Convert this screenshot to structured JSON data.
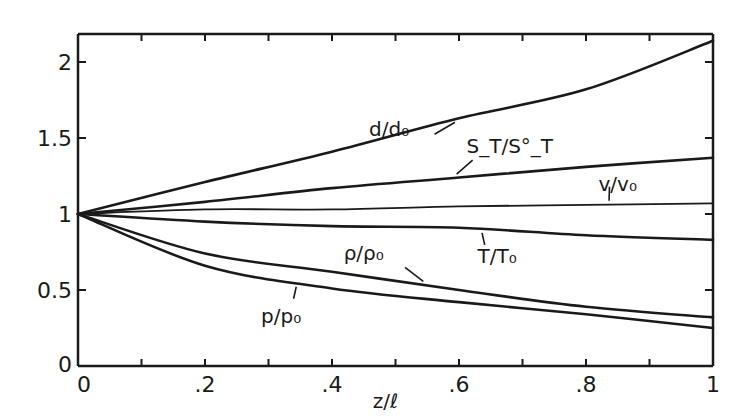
{
  "chart_data": {
    "type": "line",
    "title": "",
    "xlabel": "z/ℓ",
    "ylabel": "",
    "xlim": [
      0,
      1
    ],
    "ylim": [
      0,
      2.1
    ],
    "grid": false,
    "legend": "inline labels",
    "x_ticks": [
      0,
      0.1,
      0.2,
      0.3,
      0.4,
      0.5,
      0.6,
      0.7,
      0.8,
      0.9,
      1.0
    ],
    "x_tick_labels": [
      {
        "value": 0,
        "label": "0"
      },
      {
        "value": 0.2,
        "label": ".2"
      },
      {
        "value": 0.4,
        "label": ".4"
      },
      {
        "value": 0.6,
        "label": ".6"
      },
      {
        "value": 0.8,
        "label": ".8"
      },
      {
        "value": 1.0,
        "label": "1"
      }
    ],
    "y_tick_labels": [
      {
        "value": 0,
        "label": "0"
      },
      {
        "value": 0.5,
        "label": "0.5"
      },
      {
        "value": 1,
        "label": "1"
      },
      {
        "value": 1.5,
        "label": "1.5"
      },
      {
        "value": 2,
        "label": "2"
      }
    ],
    "x": [
      0,
      0.2,
      0.4,
      0.6,
      0.8,
      1.0
    ],
    "series": [
      {
        "name": "d/d₀",
        "key": "d",
        "values": [
          1.0,
          1.21,
          1.41,
          1.63,
          1.82,
          2.14
        ],
        "label_at": {
          "x": 0.49,
          "y": 1.51
        },
        "leader_at_x": 0.6,
        "weight": "heavy"
      },
      {
        "name": "S_T/S°_T",
        "key": "st",
        "values": [
          1.0,
          1.08,
          1.17,
          1.24,
          1.31,
          1.37
        ],
        "label_at": {
          "x": 0.68,
          "y": 1.4
        },
        "leader_at_x": 0.59,
        "weight": "heavy"
      },
      {
        "name": "v/v₀",
        "key": "v",
        "values": [
          1.0,
          1.03,
          1.03,
          1.05,
          1.06,
          1.07
        ],
        "label_at": {
          "x": 0.85,
          "y": 1.15
        },
        "leader_at_x": 0.83,
        "weight": "light"
      },
      {
        "name": "T/T₀",
        "key": "t",
        "values": [
          1.0,
          0.95,
          0.92,
          0.91,
          0.86,
          0.83
        ],
        "label_at": {
          "x": 0.66,
          "y": 0.68
        },
        "leader_at_x": 0.63,
        "weight": "heavy"
      },
      {
        "name": "ρ/ρ₀",
        "key": "rho",
        "values": [
          1.0,
          0.74,
          0.62,
          0.5,
          0.39,
          0.32
        ],
        "label_at": {
          "x": 0.45,
          "y": 0.7
        },
        "leader_at_x": 0.55,
        "weight": "heavy"
      },
      {
        "name": "p/p₀",
        "key": "p",
        "values": [
          1.0,
          0.66,
          0.51,
          0.42,
          0.34,
          0.25
        ],
        "label_at": {
          "x": 0.32,
          "y": 0.28
        },
        "leader_at_x": 0.35,
        "weight": "heavy"
      }
    ]
  }
}
